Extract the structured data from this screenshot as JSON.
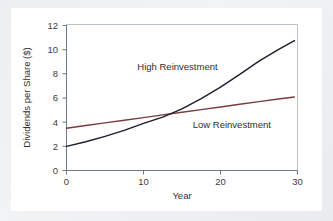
{
  "chart_data": {
    "type": "line",
    "title": "",
    "xlabel": "Year",
    "ylabel": "Dividends per Share ($)",
    "xlim": [
      0,
      30
    ],
    "ylim": [
      0,
      12
    ],
    "xticks": [
      "0",
      "10",
      "20",
      "30"
    ],
    "xtick_values": [
      0,
      10,
      20,
      30
    ],
    "yticks": [
      "0",
      "2",
      "4",
      "6",
      "8",
      "10",
      "12"
    ],
    "ytick_values": [
      0,
      2,
      4,
      6,
      8,
      10,
      12
    ],
    "grid": false,
    "legend_position": "inline-annotations",
    "x": [
      0,
      2.5,
      5,
      7.5,
      10,
      12.5,
      15,
      17.5,
      20,
      22.5,
      25,
      27.5,
      29.6
    ],
    "series": [
      {
        "name": "High Reinvestment",
        "color": "#1d1d2b",
        "values": [
          2.0,
          2.38,
          2.82,
          3.32,
          3.9,
          4.42,
          5.1,
          5.95,
          6.9,
          7.95,
          9.05,
          10.0,
          10.75
        ]
      },
      {
        "name": "Low Reinvestment",
        "color": "#7b3b42",
        "values": [
          3.5,
          3.72,
          3.94,
          4.16,
          4.38,
          4.6,
          4.82,
          5.04,
          5.26,
          5.48,
          5.7,
          5.92,
          6.08
        ]
      }
    ],
    "annotations": [
      {
        "text": "High Reinvestment",
        "x": 9.2,
        "y": 8.35
      },
      {
        "text": "Low Reinvestment",
        "x": 16.4,
        "y": 3.52
      }
    ],
    "crossing_point": {
      "x": 13.6,
      "y": 4.65
    },
    "colors": {
      "high_reinvestment": "#1d1d2b",
      "low_reinvestment": "#7b3b42",
      "axis": "#6b7a86",
      "frame": "#b9c2c9",
      "card_background": "#ffffff",
      "page_background": "#eef0f2"
    }
  }
}
